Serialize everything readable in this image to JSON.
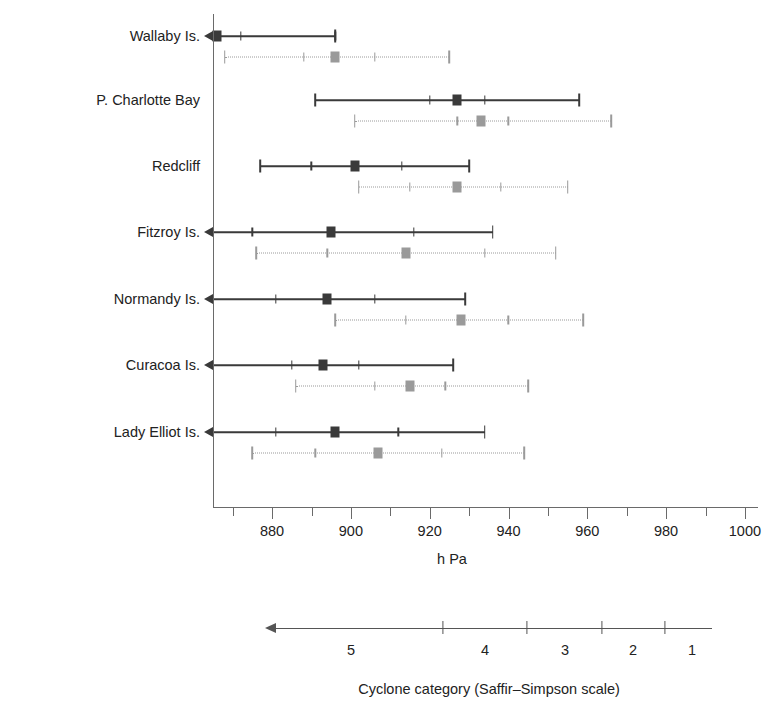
{
  "chart_data": {
    "type": "range-dot",
    "title": "",
    "xlabel": "h Pa",
    "ylabel": "",
    "xlim": [
      865,
      1005
    ],
    "grid": false,
    "legend_position": "none",
    "x_ticks": [
      870,
      880,
      890,
      900,
      910,
      920,
      930,
      940,
      950,
      960,
      970,
      980,
      990,
      1000
    ],
    "x_tick_labels": [
      "",
      "880",
      "",
      "900",
      "",
      "920",
      "",
      "940",
      "",
      "960",
      "",
      "980",
      "",
      "1000"
    ],
    "categories": [
      "Wallaby Is.",
      "P. Charlotte Bay",
      "Redcliff",
      "Fitzroy Is.",
      "Normandy Is.",
      "Curacoa Is.",
      "Lady Elliot Is."
    ],
    "series": [
      {
        "name": "dark",
        "color": "#3a3a3a",
        "dotted": false,
        "points": [
          {
            "category": "Wallaby Is.",
            "low": 865,
            "q1": 872,
            "median": 866,
            "q3": 896,
            "high": 896,
            "left_arrow": true
          },
          {
            "category": "P. Charlotte Bay",
            "low": 891,
            "q1": 920,
            "median": 927,
            "q3": 934,
            "high": 958,
            "left_arrow": false
          },
          {
            "category": "Redcliff",
            "low": 877,
            "q1": 890,
            "median": 901,
            "q3": 913,
            "high": 930,
            "left_arrow": false
          },
          {
            "category": "Fitzroy Is.",
            "low": 865,
            "q1": 875,
            "median": 895,
            "q3": 916,
            "high": 936,
            "left_arrow": true
          },
          {
            "category": "Normandy Is.",
            "low": 865,
            "q1": 881,
            "median": 894,
            "q3": 906,
            "high": 929,
            "left_arrow": true
          },
          {
            "category": "Curacoa Is.",
            "low": 865,
            "q1": 885,
            "median": 893,
            "q3": 902,
            "high": 926,
            "left_arrow": true
          },
          {
            "category": "Lady Elliot Is.",
            "low": 865,
            "q1": 881,
            "median": 896,
            "q3": 912,
            "high": 934,
            "left_arrow": true
          }
        ]
      },
      {
        "name": "light",
        "color": "#9a9a9a",
        "dotted": true,
        "points": [
          {
            "category": "Wallaby Is.",
            "low": 868,
            "q1": 888,
            "median": 896,
            "q3": 906,
            "high": 925,
            "left_arrow": false
          },
          {
            "category": "P. Charlotte Bay",
            "low": 901,
            "q1": 927,
            "median": 933,
            "q3": 940,
            "high": 966,
            "left_arrow": false
          },
          {
            "category": "Redcliff",
            "low": 902,
            "q1": 915,
            "median": 927,
            "q3": 938,
            "high": 955,
            "left_arrow": false
          },
          {
            "category": "Fitzroy Is.",
            "low": 876,
            "q1": 894,
            "median": 914,
            "q3": 934,
            "high": 952,
            "left_arrow": false
          },
          {
            "category": "Normandy Is.",
            "low": 896,
            "q1": 914,
            "median": 928,
            "q3": 940,
            "high": 959,
            "left_arrow": false
          },
          {
            "category": "Curacoa Is.",
            "low": 886,
            "q1": 906,
            "median": 915,
            "q3": 924,
            "high": 945,
            "left_arrow": false
          },
          {
            "category": "Lady Elliot Is.",
            "low": 875,
            "q1": 891,
            "median": 907,
            "q3": 923,
            "high": 944,
            "left_arrow": false
          }
        ]
      }
    ]
  },
  "cyclone_scale": {
    "caption": "Cyclone category (Saffir–Simpson scale)",
    "arrow_direction": "left",
    "ticks": [
      {
        "label": "5",
        "tick_x": null,
        "label_x": 351
      },
      {
        "label": "4",
        "tick_x": 443,
        "label_x": 485
      },
      {
        "label": "3",
        "tick_x": 527,
        "label_x": 565
      },
      {
        "label": "2",
        "tick_x": 602,
        "label_x": 633
      },
      {
        "label": "1",
        "tick_x": 665,
        "label_x": 692
      }
    ]
  }
}
